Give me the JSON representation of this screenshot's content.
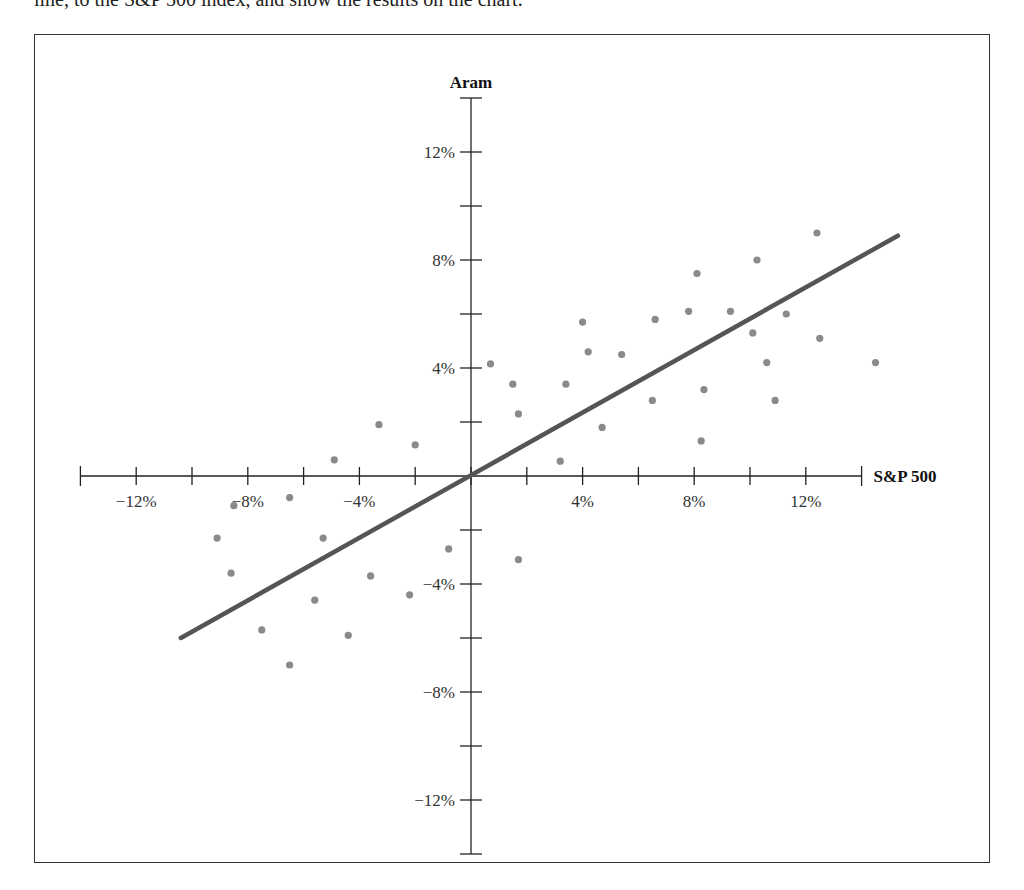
{
  "caption": "line, to the S&P 500 index, and show the results on the chart.",
  "chart_data": {
    "type": "scatter",
    "title": "",
    "xlabel": "S&P 500",
    "ylabel": "Aram",
    "xlim": [
      -14,
      14
    ],
    "ylim": [
      -14,
      14
    ],
    "x_ticks": [
      -14,
      -12,
      -10,
      -8,
      -6,
      -4,
      -2,
      0,
      2,
      4,
      6,
      8,
      10,
      12,
      14
    ],
    "x_tick_labels": [
      {
        "value": -12,
        "label": "−12%"
      },
      {
        "value": -8,
        "label": "−8%"
      },
      {
        "value": -4,
        "label": "−4%"
      },
      {
        "value": 4,
        "label": "4%"
      },
      {
        "value": 8,
        "label": "8%"
      },
      {
        "value": 12,
        "label": "12%"
      }
    ],
    "y_ticks": [
      -14,
      -12,
      -10,
      -8,
      -6,
      -4,
      -2,
      0,
      2,
      4,
      6,
      8,
      10,
      12,
      14
    ],
    "y_tick_labels": [
      {
        "value": 12,
        "label": "12%"
      },
      {
        "value": 8,
        "label": "8%"
      },
      {
        "value": 4,
        "label": "4%"
      },
      {
        "value": -4,
        "label": "−4%"
      },
      {
        "value": -8,
        "label": "−8%"
      },
      {
        "value": -12,
        "label": "−12%"
      }
    ],
    "grid": false,
    "series": [
      {
        "name": "Monthly returns",
        "color": "#8a8a8a",
        "points": [
          [
            -3.3,
            1.9
          ],
          [
            -2.0,
            1.15
          ],
          [
            -4.9,
            0.6
          ],
          [
            -6.5,
            -0.8
          ],
          [
            -8.5,
            -1.1
          ],
          [
            -9.1,
            -2.3
          ],
          [
            -5.3,
            -2.3
          ],
          [
            -0.8,
            -2.7
          ],
          [
            -8.6,
            -3.6
          ],
          [
            -3.6,
            -3.7
          ],
          [
            -2.2,
            -4.4
          ],
          [
            -5.6,
            -4.6
          ],
          [
            -7.5,
            -5.7
          ],
          [
            -4.4,
            -5.9
          ],
          [
            -6.5,
            -7.0
          ],
          [
            0.7,
            4.15
          ],
          [
            1.5,
            3.4
          ],
          [
            1.7,
            2.3
          ],
          [
            3.2,
            0.55
          ],
          [
            3.4,
            3.4
          ],
          [
            4.0,
            5.7
          ],
          [
            4.2,
            4.6
          ],
          [
            4.7,
            1.8
          ],
          [
            5.4,
            4.5
          ],
          [
            6.6,
            5.8
          ],
          [
            6.5,
            2.8
          ],
          [
            7.8,
            6.1
          ],
          [
            8.25,
            1.3
          ],
          [
            1.7,
            -3.1
          ],
          [
            12.4,
            9.0
          ],
          [
            10.25,
            8.0
          ],
          [
            8.1,
            7.5
          ],
          [
            9.3,
            6.1
          ],
          [
            11.3,
            6.0
          ],
          [
            10.1,
            5.3
          ],
          [
            12.5,
            5.1
          ],
          [
            10.6,
            4.2
          ],
          [
            14.5,
            4.2
          ],
          [
            8.35,
            3.2
          ],
          [
            10.9,
            2.8
          ]
        ]
      }
    ],
    "regression_line": {
      "name": "Characteristic line",
      "color": "#555555",
      "from": [
        -10.4,
        -6.0
      ],
      "to": [
        15.3,
        8.9
      ],
      "slope": 0.58
    }
  },
  "layout": {
    "origin_px": [
      471,
      476
    ],
    "px_per_unit_x": 27.9,
    "px_per_unit_y": 27.0
  }
}
